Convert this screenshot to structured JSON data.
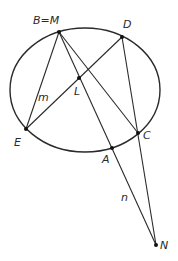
{
  "diagram": {
    "type": "geometry",
    "ellipse": {
      "cx": 85,
      "cy": 90,
      "rx": 75,
      "ry": 62
    },
    "points": [
      {
        "id": "M",
        "label": "B=M",
        "x": 59,
        "y": 32,
        "lx": 33,
        "ly": 24
      },
      {
        "id": "D",
        "label": "D",
        "x": 122,
        "y": 37,
        "lx": 123,
        "ly": 28
      },
      {
        "id": "L",
        "label": "L",
        "x": 79,
        "y": 78,
        "lx": 74,
        "ly": 95
      },
      {
        "id": "E",
        "label": "E",
        "x": 26,
        "y": 129,
        "lx": 14,
        "ly": 146
      },
      {
        "id": "C",
        "label": "C",
        "x": 138,
        "y": 133,
        "lx": 143,
        "ly": 139
      },
      {
        "id": "A",
        "label": "A",
        "x": 112,
        "y": 148,
        "lx": 102,
        "ly": 163
      },
      {
        "id": "N",
        "label": "N",
        "x": 156,
        "y": 245,
        "lx": 160,
        "ly": 249
      }
    ],
    "segments": [
      {
        "from": "M",
        "to": "E"
      },
      {
        "from": "M",
        "to": "C"
      },
      {
        "from": "M",
        "to": "N"
      },
      {
        "from": "D",
        "to": "E"
      },
      {
        "from": "D",
        "to": "N"
      }
    ],
    "line_labels": [
      {
        "label": "m",
        "x": 38,
        "y": 101
      },
      {
        "label": "n",
        "x": 121,
        "y": 201
      }
    ]
  }
}
